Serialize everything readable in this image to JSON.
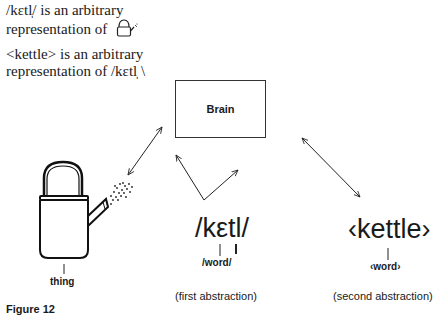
{
  "statements": {
    "line1_a": "/kεtl̩/ is an arbitrary",
    "line1_b": "representation of",
    "line1_icon": "kettle-icon",
    "line2_a": "<kettle> is an arbitrary",
    "line2_b": "representation of /kεtl̩ \\"
  },
  "diagram": {
    "brain_label": "Brain",
    "thing": {
      "icon": "kettle-icon",
      "label": "thing"
    },
    "first": {
      "symbol": "/kεtl/",
      "label": "/word/",
      "caption": "(first abstraction)"
    },
    "second": {
      "symbol": "‹kettle›",
      "label": "‹word›",
      "caption": "(second abstraction)"
    }
  },
  "figure_caption": "Figure 12"
}
